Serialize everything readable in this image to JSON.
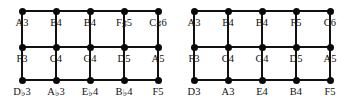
{
  "figure": {
    "type": "note-lattice-pair",
    "background_color": "#ffffff",
    "node_color": "#0a0a0a",
    "edge_color": "#111111"
  },
  "lattices": [
    {
      "name": "left-lattice",
      "columns": 5,
      "rows": 3,
      "grid": [
        [
          "A3",
          "E4",
          "B4",
          "F♯5",
          "C♯6"
        ],
        [
          "F3",
          "C4",
          "G4",
          "D5",
          "A5"
        ],
        [
          "D♭3",
          "A♭3",
          "E♭4",
          "B♭4",
          "F5"
        ]
      ]
    },
    {
      "name": "right-lattice",
      "columns": 5,
      "rows": 3,
      "grid": [
        [
          "A3",
          "E4",
          "B4",
          "F5",
          "C6"
        ],
        [
          "F3",
          "C4",
          "G4",
          "D5",
          "A5"
        ],
        [
          "D3",
          "A3",
          "E4",
          "B4",
          "F5"
        ]
      ]
    }
  ]
}
